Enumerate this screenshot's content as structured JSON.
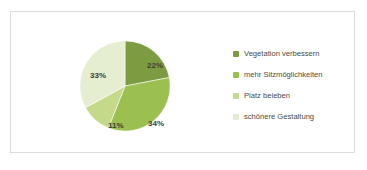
{
  "chart_data": {
    "type": "pie",
    "title": "",
    "xlabel": "",
    "ylabel": "",
    "legend_position": "right",
    "grid": false,
    "unit": "%",
    "categories": [
      "Vegetation verbessern",
      "mehr Sitzmöglichkeiten",
      "Platz beleben",
      "schönere Gestaltung"
    ],
    "values": [
      22,
      34,
      11,
      33
    ],
    "data_labels": [
      "22%",
      "34%",
      "11%",
      "33%"
    ],
    "colors": [
      "#7d9b40",
      "#9bc04f",
      "#c5d98a",
      "#e6eed2"
    ],
    "slices": [
      {
        "label": "Vegetation verbessern",
        "value": 22,
        "data_label": "22%",
        "color": "#7d9b40"
      },
      {
        "label": "mehr Sitzmöglichkeiten",
        "value": 34,
        "data_label": "34%",
        "color": "#9bc04f"
      },
      {
        "label": "Platz beleben",
        "value": 11,
        "data_label": "11%",
        "color": "#c5d98a"
      },
      {
        "label": "schönere Gestaltung",
        "value": 33,
        "data_label": "33%",
        "color": "#e6eed2"
      }
    ]
  },
  "legend": {
    "items": [
      {
        "label": "Vegetation verbessern",
        "color": "#7d9b40"
      },
      {
        "label": "mehr Sitzmöglichkeiten",
        "color": "#9bc04f"
      },
      {
        "label": "Platz beleben",
        "color": "#c5d98a"
      },
      {
        "label": "schönere Gestaltung",
        "color": "#e6eed2"
      }
    ]
  },
  "frame": {
    "border_color": "#dcdcdc",
    "background": "#ffffff"
  }
}
